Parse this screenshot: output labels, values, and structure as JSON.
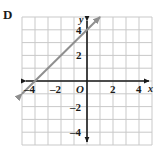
{
  "figure": {
    "choice_letter": "D",
    "origin_label": "O",
    "x_axis_name": "x",
    "y_axis_name": "y"
  },
  "colors": {
    "grid": "#c9c9c9",
    "axis": "#1a1a1a",
    "line": "#8f8f8f",
    "text": "#1a1a1a",
    "background": "#ffffff"
  },
  "chart_data": {
    "type": "line",
    "title": "",
    "xlabel": "x",
    "ylabel": "y",
    "xlim": [
      -5,
      5
    ],
    "ylim": [
      -5,
      5
    ],
    "grid": true,
    "legend": false,
    "x_ticks": [
      -4,
      -2,
      2,
      4
    ],
    "y_ticks": [
      -4,
      -2,
      2,
      4
    ],
    "x_tick_labels": [
      "–4",
      "–2",
      "2",
      "4"
    ],
    "y_tick_labels": [
      "–4",
      "–2",
      "2",
      "4"
    ],
    "series": [
      {
        "name": "y = x + 4",
        "slope": 1,
        "intercept": 4,
        "arrows": "both",
        "x": [
          -5,
          1
        ],
        "values": [
          -1,
          5
        ],
        "points": [
          [
            -4,
            0
          ],
          [
            -2,
            2
          ],
          [
            0,
            4
          ]
        ]
      }
    ]
  }
}
